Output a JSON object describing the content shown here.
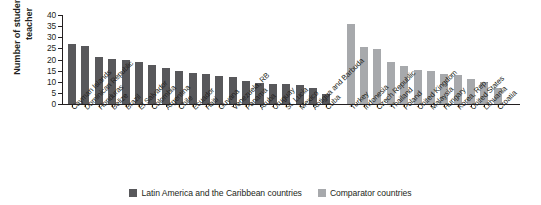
{
  "chart_data": {
    "type": "bar",
    "title": "",
    "xlabel": "",
    "ylabel": "Number of students per teacher",
    "ylim": [
      0,
      40
    ],
    "yticks": [
      0,
      5,
      10,
      15,
      20,
      25,
      30,
      35,
      40
    ],
    "grid": false,
    "legend_position": "bottom-center",
    "categories": [
      "Cayman Islands",
      "Dominican Republic",
      "Honduras",
      "Belize",
      "Brazil",
      "El Salvador",
      "Colombia",
      "Argentina",
      "Chile",
      "Ecuador",
      "Haiti",
      "Guyana",
      "Venezuela, RB",
      "Panama",
      "Aruba",
      "Uruguay",
      "St. Lucia",
      "Mexico",
      "Antigua and Barbuda",
      "Cuba",
      "Turkey",
      "Indonesia",
      "Czech Republic",
      "Thailand",
      "Poland",
      "United Kingdom",
      "Malaysia",
      "Hungary",
      "Korea, Rep.",
      "United States",
      "Lithuania",
      "Croatia"
    ],
    "series": [
      {
        "name": "Latin America and the Caribbean countries",
        "color": "#58585b",
        "values": [
          26.8,
          26.0,
          21.3,
          20.2,
          19.7,
          18.8,
          17.7,
          16.4,
          14.7,
          14.0,
          13.6,
          12.5,
          12.3,
          10.2,
          9.3,
          9.1,
          8.9,
          8.4,
          7.3,
          4.7,
          null,
          null,
          null,
          null,
          null,
          null,
          null,
          null,
          null,
          null,
          null,
          null
        ]
      },
      {
        "name": "Comparator countries",
        "color": "#a7a9ac",
        "values": [
          null,
          null,
          null,
          null,
          null,
          null,
          null,
          null,
          null,
          null,
          null,
          null,
          null,
          null,
          null,
          null,
          null,
          null,
          null,
          null,
          36.0,
          25.5,
          24.6,
          19.1,
          17.1,
          15.1,
          14.7,
          13.7,
          13.0,
          11.2,
          10.1,
          7.4
        ]
      }
    ]
  },
  "legend": {
    "items": [
      {
        "label": "Latin America and the Caribbean countries",
        "color": "#58585b"
      },
      {
        "label": "Comparator countries",
        "color": "#a7a9ac"
      }
    ]
  },
  "axis": {
    "y_title": "Number of students per teacher"
  }
}
